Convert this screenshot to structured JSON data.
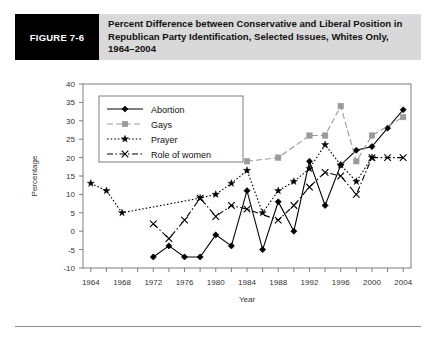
{
  "figure": {
    "tag": "FIGURE 7-6",
    "title": "Percent Difference between Conservative and Liberal Position in Republican Party Identification, Selected Issues, Whites Only, 1964–2004"
  },
  "colors": {
    "header_band": "#d9d9d9",
    "tag_background": "#000000",
    "tag_text": "#ffffff",
    "abortion": "#000000",
    "gays": "#9a9a9a",
    "prayer": "#000000",
    "role_of_women": "#000000",
    "axis": "#555555"
  },
  "chart_data": {
    "type": "line",
    "xlabel": "Year",
    "ylabel": "Percentage",
    "xlim": [
      1963,
      2005
    ],
    "ylim": [
      -10,
      40
    ],
    "ytick_step": 5,
    "yticks": [
      -10,
      -5,
      0,
      5,
      10,
      15,
      20,
      25,
      30,
      35,
      40
    ],
    "xticks": [
      1964,
      1968,
      1972,
      1976,
      1980,
      1984,
      1988,
      1992,
      1996,
      2000,
      2004
    ],
    "xtick_labels": [
      "1964",
      "1968",
      "1972",
      "1976",
      "1980",
      "1984",
      "1988",
      "1992",
      "1996",
      "2000",
      "2004"
    ],
    "minor_xticks_every": 2,
    "grid": false,
    "legend_position": "upper left inside",
    "series": [
      {
        "name": "Abortion",
        "marker": "filled-diamond",
        "line_style": "solid",
        "color": "#000000",
        "x": [
          1972,
          1974,
          1976,
          1978,
          1980,
          1982,
          1984,
          1986,
          1988,
          1990,
          1992,
          1994,
          1996,
          1998,
          2000,
          2002,
          2004
        ],
        "values": [
          -7,
          -4,
          -7,
          -7,
          -1,
          -4,
          11,
          -5,
          8,
          0,
          19,
          7,
          18,
          22,
          23,
          28,
          33
        ]
      },
      {
        "name": "Gays",
        "marker": "filled-square",
        "line_style": "dashed",
        "color": "#9a9a9a",
        "x": [
          1984,
          1988,
          1992,
          1994,
          1996,
          1998,
          2000,
          2004
        ],
        "values": [
          19,
          20,
          26,
          26,
          34,
          19,
          26,
          31
        ]
      },
      {
        "name": "Prayer",
        "marker": "star",
        "line_style": "dotted",
        "color": "#000000",
        "x": [
          1964,
          1966,
          1968,
          1978,
          1980,
          1982,
          1984,
          1986,
          1988,
          1990,
          1992,
          1994,
          1996,
          1998,
          2000
        ],
        "values": [
          13,
          11,
          5,
          9,
          10,
          13,
          16.5,
          5,
          11,
          13.5,
          17,
          23.5,
          18,
          13.5,
          20
        ]
      },
      {
        "name": "Role of women",
        "marker": "x",
        "line_style": "dash-dot",
        "color": "#000000",
        "x": [
          1972,
          1974,
          1976,
          1978,
          1980,
          1982,
          1984,
          1988,
          1990,
          1992,
          1994,
          1996,
          1998,
          2000,
          2002,
          2004
        ],
        "values": [
          2,
          -2,
          3,
          9,
          4,
          7,
          6,
          3,
          7,
          12,
          16,
          15,
          10,
          20,
          20,
          20
        ]
      }
    ]
  }
}
